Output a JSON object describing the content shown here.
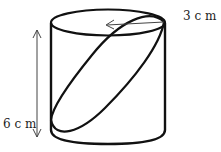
{
  "diagram": {
    "type": "cylinder-with-inclined-ellipse-section",
    "labels": {
      "radius": "3 c m",
      "height": "6 c m"
    },
    "colors": {
      "stroke": "#111111",
      "arrow": "#444444",
      "background": "#ffffff"
    }
  }
}
